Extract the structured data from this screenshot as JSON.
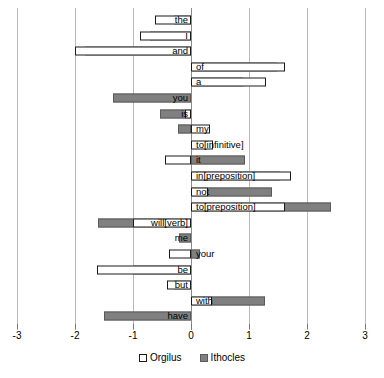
{
  "chart_data": {
    "type": "bar",
    "orientation": "horizontal",
    "title": "",
    "xlabel": "",
    "ylabel": "",
    "xlim": [
      -3,
      3
    ],
    "xticks": [
      -3,
      -2,
      -1,
      0,
      1,
      2,
      3
    ],
    "xtick_labels": [
      "-3",
      "-2",
      "-1",
      "0",
      "1",
      "2",
      "3"
    ],
    "grid": true,
    "legend_position": "bottom",
    "categories": [
      "the",
      "I",
      "and",
      "of",
      "a",
      "you",
      "is",
      "my",
      "to[infinitive]",
      "it",
      "in[preposition]",
      "not",
      "to[preposition]",
      "will[verb]",
      "me",
      "your",
      "be",
      "but",
      "with",
      "have"
    ],
    "series": [
      {
        "name": "Orgilus",
        "color": "#ffffff",
        "values": [
          -0.62,
          -0.88,
          -2.0,
          1.62,
          1.3,
          0.0,
          -0.1,
          0.33,
          0.38,
          -0.45,
          1.73,
          0.3,
          1.62,
          -1.0,
          0.0,
          -0.38,
          -1.62,
          -0.42,
          0.37,
          0.0
        ]
      },
      {
        "name": "Ithocles",
        "color": "#808080",
        "values": [
          -0.3,
          -0.7,
          -1.83,
          1.48,
          0.9,
          -1.35,
          -0.53,
          -0.22,
          0.0,
          0.93,
          1.53,
          1.4,
          2.42,
          -1.6,
          -0.2,
          0.15,
          -1.0,
          -0.3,
          1.28,
          -1.5
        ]
      }
    ]
  },
  "legend": {
    "items": [
      {
        "label": "Orgilus"
      },
      {
        "label": "Ithocles"
      }
    ]
  }
}
